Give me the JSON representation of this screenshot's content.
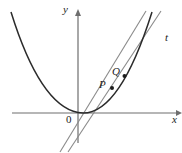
{
  "figure": {
    "kind": "math-diagram",
    "background_color": "#ffffff",
    "axes": {
      "x_label": "x",
      "y_label": "y",
      "origin_label": "0",
      "color": "#6e6e6e",
      "x_axis_y": 113,
      "y_axis_x": 78,
      "x_axis_start": 12,
      "x_axis_end": 178,
      "y_axis_top": 12,
      "y_axis_bottom": 143
    },
    "curve": {
      "name": "parabola",
      "color": "#2b2b2b",
      "width": 1.4,
      "vertex_x": 78,
      "vertex_y": 113,
      "path": "M 11,12 Q 40,105 78,112.6 Q 118,120 152,12"
    },
    "points": [
      {
        "label": "P",
        "x": 112,
        "y": 88,
        "radius": 2.0,
        "color": "#1c1c1c"
      },
      {
        "label": "Q",
        "x": 124.5,
        "y": 76,
        "radius": 2.0,
        "color": "#1c1c1c"
      }
    ],
    "lines": [
      {
        "name": "secant-line-pq",
        "label": "",
        "color": "#8a8a8a",
        "width": 1.1,
        "x1": 60,
        "y1": 152,
        "x2": 146,
        "y2": 11
      },
      {
        "name": "tangent-line-t",
        "label": "t",
        "color": "#8a8a8a",
        "width": 1.1,
        "x1": 68,
        "y1": 152,
        "x2": 161,
        "y2": 11
      }
    ],
    "line_label_t": "t"
  }
}
